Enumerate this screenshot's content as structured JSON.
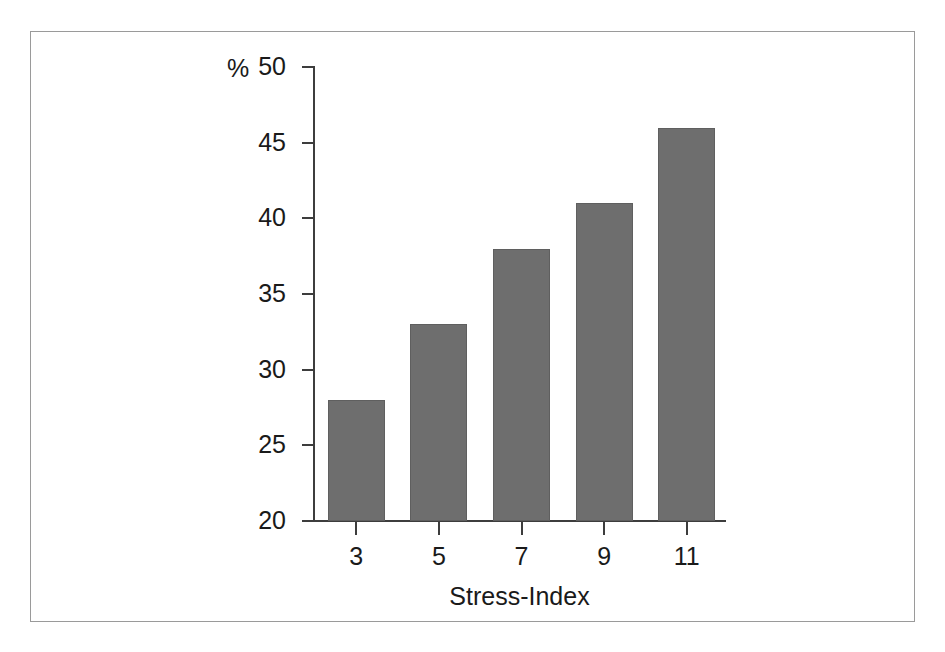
{
  "chart_data": {
    "type": "bar",
    "title": "",
    "subtitle": "",
    "xlabel": "Stress-Index",
    "ylabel": "%",
    "categories": [
      "3",
      "5",
      "7",
      "9",
      "11"
    ],
    "values": [
      28,
      33,
      38,
      41,
      46
    ],
    "ylim": [
      20,
      50
    ],
    "yticks": [
      20,
      25,
      30,
      35,
      40,
      45,
      50
    ],
    "ytick_labels": [
      "20",
      "25",
      "30",
      "35",
      "40",
      "45",
      "50"
    ],
    "grid": false,
    "legend": null,
    "legend_position": "none",
    "series": [
      {
        "name": "percent",
        "values": [
          28,
          33,
          38,
          41,
          46
        ]
      }
    ],
    "annotations": []
  },
  "figure": {
    "bar_color": "#6e6e6e",
    "axis_color": "#3d3d3d",
    "frame_color": "#9a9a9a",
    "background": "#ffffff"
  }
}
